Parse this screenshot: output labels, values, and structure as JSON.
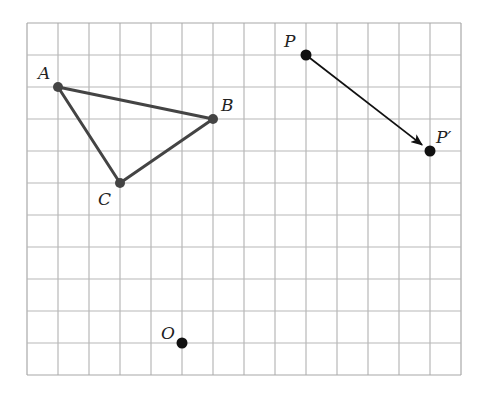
{
  "diagram": {
    "type": "coordinate-grid-transformation",
    "grid": {
      "columns": 14,
      "rows": 11,
      "origin_px": [
        27,
        23
      ],
      "cell_w": 31,
      "cell_h": 32,
      "line_color": "#b8b8b8",
      "border_color": "#a8a8a8"
    },
    "triangle": {
      "color": "#444444",
      "vertices": [
        {
          "label": "A",
          "col": 1,
          "row": 2,
          "label_dx": -20,
          "label_dy": -8
        },
        {
          "label": "B",
          "col": 6,
          "row": 3,
          "label_dx": 8,
          "label_dy": -8
        },
        {
          "label": "C",
          "col": 3,
          "row": 5,
          "label_dx": -22,
          "label_dy": 22
        }
      ]
    },
    "translation": {
      "from": {
        "label": "P",
        "col": 9,
        "row": 1,
        "label_dx": -22,
        "label_dy": -8
      },
      "to": {
        "label": "P′",
        "col": 13,
        "row": 4,
        "label_dx": 6,
        "label_dy": -8
      },
      "arrow_color": "#111111"
    },
    "center_point": {
      "label": "O",
      "col": 5,
      "row": 10,
      "label_dx": -21,
      "label_dy": -4
    },
    "point_color": "#111111"
  }
}
